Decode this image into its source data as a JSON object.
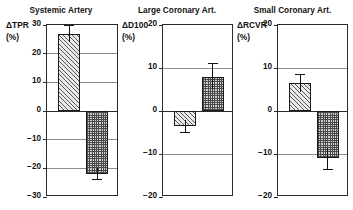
{
  "figure": {
    "width": 353,
    "height": 210,
    "background": "#ffffff",
    "ink_color": "#1a1a1a",
    "grid_color": "#8c8c8c"
  },
  "series_legend": {
    "mx_label": "MX",
    "pn_label": "PN",
    "mx_pattern": "diagonal-hatch",
    "pn_pattern": "cross-dot-grid"
  },
  "chart_data": [
    {
      "type": "bar",
      "title": "Systemic Artery",
      "ylabel": "ΔTPR",
      "yunit": "(%)",
      "xlabel": "",
      "categories": [
        "MX",
        "PN"
      ],
      "values": [
        27,
        -22
      ],
      "errors": [
        3,
        2
      ],
      "ylim": [
        -30,
        30
      ],
      "yticks": [
        30,
        20,
        10,
        0,
        -10,
        -20,
        -30
      ],
      "yticklabels": [
        "30",
        "20",
        "10",
        "0",
        "−10",
        "−20",
        "−30"
      ],
      "grid": true,
      "legend": "none"
    },
    {
      "type": "bar",
      "title": "Large Coronary Art.",
      "ylabel": "ΔD100",
      "yunit": "(%)",
      "xlabel": "",
      "categories": [
        "MX",
        "PN"
      ],
      "values": [
        -3.5,
        8
      ],
      "errors": [
        1.5,
        3
      ],
      "ylim": [
        -20,
        20
      ],
      "yticks": [
        20,
        10,
        0,
        -10,
        -20
      ],
      "yticklabels": [
        "20",
        "10",
        "0",
        "−10",
        "−20"
      ],
      "grid": true,
      "legend": "none"
    },
    {
      "type": "bar",
      "title": "Small Coronary Art.",
      "ylabel": "ΔRCVR",
      "yunit": "(%)",
      "xlabel": "",
      "categories": [
        "MX",
        "PN"
      ],
      "values": [
        6.5,
        -11
      ],
      "errors": [
        2,
        2.5
      ],
      "ylim": [
        -20,
        20
      ],
      "yticks": [
        20,
        10,
        0,
        -10,
        -20
      ],
      "yticklabels": [
        "20",
        "10",
        "0",
        "−10",
        "−20"
      ],
      "grid": true,
      "legend": "none"
    }
  ]
}
